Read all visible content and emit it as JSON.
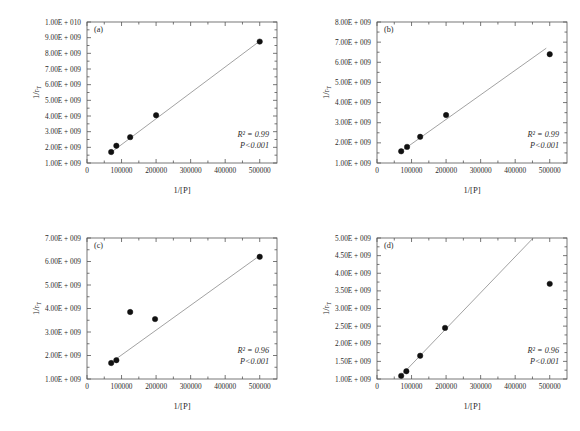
{
  "figure": {
    "background": "#ffffff",
    "marker_color": "#111111",
    "line_color": "#8a8a8a",
    "axis_color": "#555555"
  },
  "chart_data": [
    {
      "type": "scatter",
      "panel": "(a)",
      "title": "",
      "xlabel": "1/[P]",
      "ylabel": "1/r",
      "ylabel_sub": "T",
      "xlim": [
        0,
        550000
      ],
      "ylim": [
        1000000000,
        10000000000
      ],
      "grid": false,
      "legend": "none",
      "xticks": [
        0,
        100000,
        200000,
        300000,
        400000,
        500000
      ],
      "xticklabels": [
        "0",
        "100000",
        "200000",
        "300000",
        "400000",
        "500000"
      ],
      "yticks": [
        1000000000,
        2000000000,
        3000000000,
        4000000000,
        5000000000,
        6000000000,
        7000000000,
        8000000000,
        9000000000,
        10000000000
      ],
      "yticklabels": [
        "1.00E + 009",
        "2.00E + 009",
        "3.00E + 009",
        "4.00E + 009",
        "5.00E + 009",
        "6.00E + 009",
        "7.00E + 009",
        "8.00E + 009",
        "9.00E + 009",
        "1.00E + 010"
      ],
      "x": [
        70000,
        85000,
        125000,
        200000,
        500000
      ],
      "y": [
        1700000000,
        2100000000,
        2650000000,
        4050000000,
        8750000000
      ],
      "fit": {
        "x": [
          70000,
          500000
        ],
        "y": [
          1680000000,
          8780000000
        ]
      },
      "annotations": [
        "R² = 0.99",
        "P<0.001"
      ],
      "r_squared": "R² = 0.99",
      "p_value": "P<0.001"
    },
    {
      "type": "scatter",
      "panel": "(b)",
      "title": "",
      "xlabel": "1/[P]",
      "ylabel": "1/r",
      "ylabel_sub": "T",
      "xlim": [
        0,
        550000
      ],
      "ylim": [
        1000000000,
        8000000000
      ],
      "grid": false,
      "legend": "none",
      "xticks": [
        0,
        100000,
        200000,
        300000,
        400000,
        500000
      ],
      "xticklabels": [
        "0",
        "100000",
        "200000",
        "300000",
        "400000",
        "500000"
      ],
      "yticks": [
        1000000000,
        2000000000,
        3000000000,
        4000000000,
        5000000000,
        6000000000,
        7000000000,
        8000000000
      ],
      "yticklabels": [
        "1.00E + 009",
        "2.00E + 009",
        "3.00E + 009",
        "4.00E + 009",
        "5.00E + 009",
        "6.00E + 009",
        "7.00E + 009",
        "8.00E + 009"
      ],
      "x": [
        70000,
        87000,
        125000,
        200000,
        500000
      ],
      "y": [
        1580000000,
        1800000000,
        2300000000,
        3380000000,
        6400000000
      ],
      "fit": {
        "x": [
          65000,
          490000
        ],
        "y": [
          1520000000,
          6700000000
        ]
      },
      "annotations": [
        "R² = 0.99",
        "P<0.001"
      ],
      "r_squared": "R² = 0.99",
      "p_value": "P<0.001"
    },
    {
      "type": "scatter",
      "panel": "(c)",
      "title": "",
      "xlabel": "1/[P]",
      "ylabel": "1/r",
      "ylabel_sub": "T",
      "xlim": [
        0,
        550000
      ],
      "ylim": [
        1000000000,
        7000000000
      ],
      "grid": false,
      "legend": "none",
      "xticks": [
        0,
        100000,
        200000,
        300000,
        400000,
        500000
      ],
      "xticklabels": [
        "0",
        "100000",
        "200000",
        "300000",
        "400000",
        "500000"
      ],
      "yticks": [
        1000000000,
        2000000000,
        3000000000,
        4000000000,
        5000000000,
        6000000000,
        7000000000
      ],
      "yticklabels": [
        "1.00E + 009",
        "2.00E + 009",
        "3.00E + 009",
        "4.00E + 009",
        "5.00E + 009",
        "6.00E + 009",
        "7.00E + 009"
      ],
      "x": [
        70000,
        85000,
        125000,
        197000,
        500000
      ],
      "y": [
        1680000000,
        1800000000,
        3850000000,
        3550000000,
        6200000000
      ],
      "fit": {
        "x": [
          82000,
          500000
        ],
        "y": [
          1830000000,
          6250000000
        ]
      },
      "annotations": [
        "R² = 0.96",
        "P<0.001"
      ],
      "r_squared": "R² = 0.96",
      "p_value": "P<0.001"
    },
    {
      "type": "scatter",
      "panel": "(d)",
      "title": "",
      "xlabel": "1/[P]",
      "ylabel": "1/r",
      "ylabel_sub": "T",
      "xlim": [
        0,
        550000
      ],
      "ylim": [
        1000000000,
        5000000000
      ],
      "grid": false,
      "legend": "none",
      "xticks": [
        0,
        100000,
        200000,
        300000,
        400000,
        500000
      ],
      "xticklabels": [
        "0",
        "100000",
        "200000",
        "300000",
        "400000",
        "500000"
      ],
      "yticks": [
        1000000000,
        1500000000,
        2000000000,
        2500000000,
        3000000000,
        3500000000,
        4000000000,
        4500000000,
        5000000000
      ],
      "yticklabels": [
        "1.00E + 009",
        "1.50E + 009",
        "2.00E + 009",
        "2.50E + 009",
        "3.00E + 009",
        "3.50E + 009",
        "4.00E + 009",
        "4.50E + 009",
        "5.00E + 009"
      ],
      "x": [
        70000,
        85000,
        125000,
        197000,
        500000
      ],
      "y": [
        1090000000,
        1220000000,
        1660000000,
        2450000000,
        3700000000
      ],
      "fit": {
        "x": [
          62000,
          460000
        ],
        "y": [
          1020000000,
          5080000000
        ]
      },
      "annotations": [
        "R² = 0.96",
        "P<0.001"
      ],
      "r_squared": "R² = 0.96",
      "p_value": "P<0.001"
    }
  ]
}
